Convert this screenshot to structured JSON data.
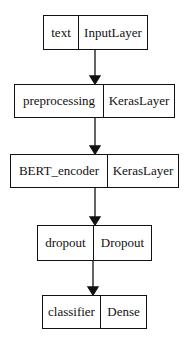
{
  "diagram": {
    "type": "keras-model-plot",
    "nodes": [
      {
        "id": "text",
        "name": "text",
        "layer_type": "InputLayer"
      },
      {
        "id": "preprocessing",
        "name": "preprocessing",
        "layer_type": "KerasLayer"
      },
      {
        "id": "BERT_encoder",
        "name": "BERT_encoder",
        "layer_type": "KerasLayer"
      },
      {
        "id": "dropout",
        "name": "dropout",
        "layer_type": "Dropout"
      },
      {
        "id": "classifier",
        "name": "classifier",
        "layer_type": "Dense"
      }
    ],
    "edges": [
      {
        "from": "text",
        "to": "preprocessing"
      },
      {
        "from": "preprocessing",
        "to": "BERT_encoder"
      },
      {
        "from": "BERT_encoder",
        "to": "dropout"
      },
      {
        "from": "dropout",
        "to": "classifier"
      }
    ],
    "colors": {
      "stroke": "#111111",
      "background": "#ffffff"
    }
  }
}
